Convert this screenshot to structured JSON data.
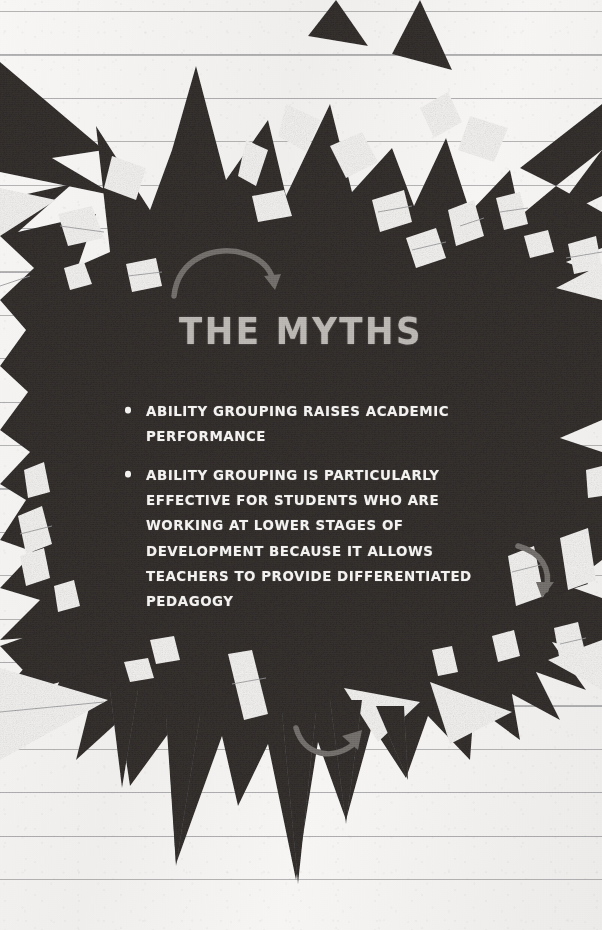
{
  "slide": {
    "width": 602,
    "height": 930,
    "background_kind": "ruled-notebook-paper",
    "paper_color": "#f4f3f1",
    "rule_line_color": "#76767a",
    "shape_color": "#332f2e",
    "accent_arrow_color": "#6f6b68",
    "title_color": "#b9b6b2",
    "body_text_color": "#f3f2f0"
  },
  "title": {
    "text": "THE MYTHS"
  },
  "bullets": [
    {
      "marker": "•",
      "text": "ABILITY GROUPING RAISES ACADEMIC PERFORMANCE"
    },
    {
      "marker": "•",
      "text": "ABILITY GROUPING IS PARTICULARLY EFFECTIVE FOR STUDENTS WHO ARE WORKING AT LOWER STAGES OF DEVELOPMENT BECAUSE IT ALLOWS TEACHERS TO PROVIDE DIFFERENTIATED PEDAGOGY"
    }
  ],
  "arrows": [
    {
      "name": "curved-arrow-top",
      "direction": "clockwise-down-right"
    },
    {
      "name": "curved-arrow-right",
      "direction": "clockwise-down-left"
    },
    {
      "name": "curved-arrow-bottom",
      "direction": "counterclockwise-up-right"
    }
  ]
}
